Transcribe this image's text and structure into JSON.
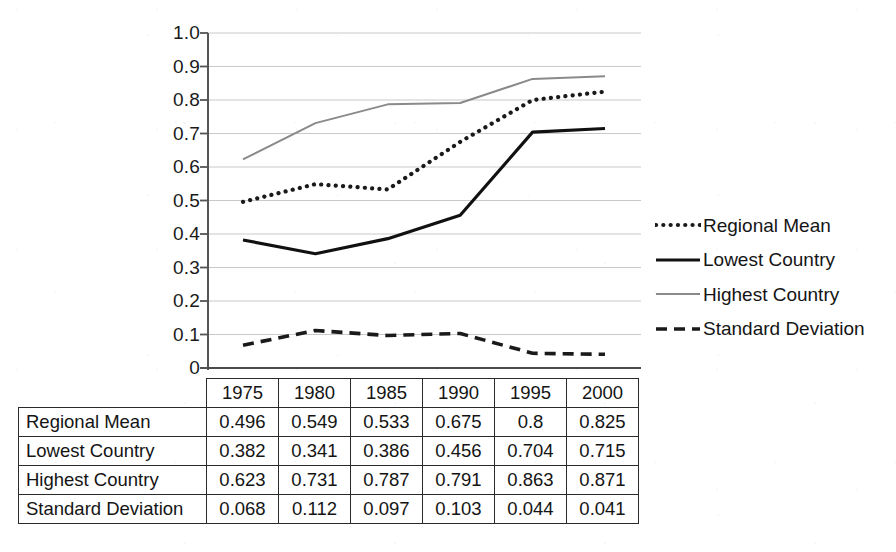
{
  "chart_data": {
    "type": "line",
    "title": "",
    "xlabel": "",
    "ylabel": "",
    "categories": [
      "1975",
      "1980",
      "1985",
      "1990",
      "1995",
      "2000"
    ],
    "ylim": [
      0,
      1.0
    ],
    "ytick_labels": [
      "1.0",
      "0.9",
      "0.8",
      "0.7",
      "0.6",
      "0.5",
      "0.4",
      "0.3",
      "0.2",
      "0.1",
      "0"
    ],
    "ytick_values": [
      1.0,
      0.9,
      0.8,
      0.7,
      0.6,
      0.5,
      0.4,
      0.3,
      0.2,
      0.1,
      0
    ],
    "grid": true,
    "legend_position": "right",
    "series": [
      {
        "name": "Regional Mean",
        "style": "dotted",
        "color": "#1a1a1a",
        "values": [
          0.496,
          0.549,
          0.533,
          0.675,
          0.8,
          0.825
        ],
        "labels": [
          "0.496",
          "0.549",
          "0.533",
          "0.675",
          "0.8",
          "0.825"
        ]
      },
      {
        "name": "Lowest Country",
        "style": "solid",
        "color": "#111111",
        "values": [
          0.382,
          0.341,
          0.386,
          0.456,
          0.704,
          0.715
        ],
        "labels": [
          "0.382",
          "0.341",
          "0.386",
          "0.456",
          "0.704",
          "0.715"
        ]
      },
      {
        "name": "Highest Country",
        "style": "solid-thin",
        "color": "#8a8a8a",
        "values": [
          0.623,
          0.731,
          0.787,
          0.791,
          0.863,
          0.871
        ],
        "labels": [
          "0.623",
          "0.731",
          "0.787",
          "0.791",
          "0.863",
          "0.871"
        ]
      },
      {
        "name": "Standard Deviation",
        "style": "dashed",
        "color": "#1a1a1a",
        "values": [
          0.068,
          0.112,
          0.097,
          0.103,
          0.044,
          0.041
        ],
        "labels": [
          "0.068",
          "0.112",
          "0.097",
          "0.103",
          "0.044",
          "0.041"
        ]
      }
    ]
  },
  "legend": {
    "items": [
      {
        "label": "Regional Mean"
      },
      {
        "label": "Lowest Country"
      },
      {
        "label": "Highest Country"
      },
      {
        "label": "Standard Deviation"
      }
    ]
  },
  "table": {
    "header": [
      "",
      "1975",
      "1980",
      "1985",
      "1990",
      "1995",
      "2000"
    ],
    "rows": [
      {
        "label": "Regional Mean",
        "values": [
          "0.496",
          "0.549",
          "0.533",
          "0.675",
          "0.8",
          "0.825"
        ]
      },
      {
        "label": "Lowest Country",
        "values": [
          "0.382",
          "0.341",
          "0.386",
          "0.456",
          "0.704",
          "0.715"
        ]
      },
      {
        "label": "Highest Country",
        "values": [
          "0.623",
          "0.731",
          "0.787",
          "0.791",
          "0.863",
          "0.871"
        ]
      },
      {
        "label": "Standard Deviation",
        "values": [
          "0.068",
          "0.112",
          "0.097",
          "0.103",
          "0.044",
          "0.041"
        ]
      }
    ]
  }
}
